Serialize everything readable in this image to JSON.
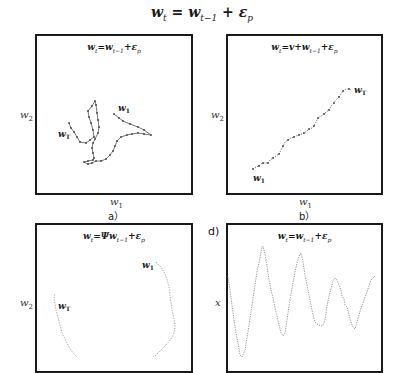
{
  "figure": {
    "equation_main": {
      "base": "w",
      "sub": "t",
      "rhs_base": "w",
      "rhs_sub": "t−1",
      "plus": "+",
      "eps": "ε",
      "eps_sub": "p",
      "eq": "="
    },
    "panels": [
      {
        "id": "a",
        "title": "w_t=w_{t-1}+ε_p",
        "xlabel": "w_1",
        "ylabel": "w_2",
        "caption": "a）",
        "start_label": "w_1",
        "end_label": "w_T"
      },
      {
        "id": "b",
        "title": "w_t=v+w_{t-1}+ε_p",
        "xlabel": "w_1",
        "ylabel": "w_2",
        "caption": "b）",
        "start_label": "w_1",
        "end_label": "w_T"
      },
      {
        "id": "c",
        "title": "w_t=Ψw_{t-1}+ε_p",
        "ylabel": "w_2",
        "start_label": "w_1",
        "end_label": "w_T"
      },
      {
        "id": "d",
        "title": "w_t=w_{t-1}+ε_p",
        "ylabel": "x",
        "panel_label": "d)"
      }
    ],
    "line_color": "#555555",
    "marker_color": "#444444"
  },
  "text": {
    "a_title_w": "w",
    "a_title_t": "t",
    "a_title_eq": "=w",
    "a_title_tm1": "t−1",
    "a_title_plus": "+ε",
    "a_title_p": "p",
    "b_title_w": "w",
    "b_title_t": "t",
    "b_title_eq": "=v+w",
    "b_title_tm1": "t−1",
    "b_title_plus": "+ε",
    "b_title_p": "p",
    "c_title_w": "w",
    "c_title_t": "t",
    "c_title_eq": "=Ψw",
    "c_title_tm1": "t−1",
    "c_title_plus": "+ε",
    "c_title_p": "p",
    "d_title_w": "w",
    "d_title_t": "t",
    "d_title_eq": "=w",
    "d_title_tm1": "t−1",
    "d_title_plus": "+ε",
    "d_title_p": "p",
    "w": "w",
    "sub1": "1",
    "sub2": "2",
    "subT": "T",
    "caption_a": "a）",
    "caption_b": "b）",
    "d_label": "d)",
    "x_label": "x"
  }
}
